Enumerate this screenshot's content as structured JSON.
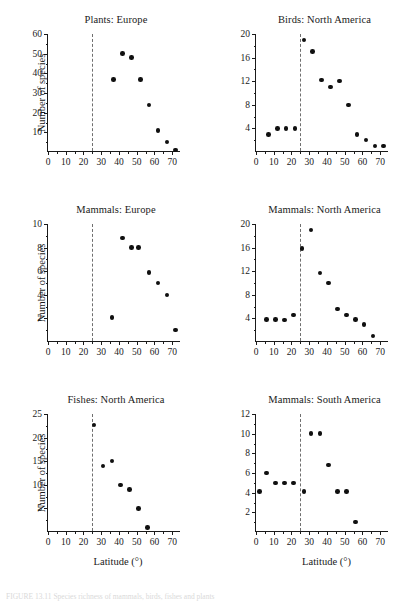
{
  "figure": {
    "caption_fragment": "FIGURE 13.11  Species richness of mammals, birds, fishes and plants",
    "dashed_line_label": "25",
    "shared_ylabel": "Number of species",
    "shared_xlabel": "Latitude (°)"
  },
  "chart_data": [
    {
      "type": "scatter",
      "title": "Plants: Europe",
      "xlabel": "",
      "ylabel": "Number of species",
      "xlim": [
        0,
        75
      ],
      "ylim": [
        0,
        60
      ],
      "xticks": [
        0,
        10,
        20,
        30,
        40,
        50,
        60,
        70
      ],
      "yticks": [
        10,
        20,
        30,
        40,
        50,
        60
      ],
      "xtick_labels": [
        "0",
        "10",
        "20",
        "30",
        "40",
        "50",
        "60",
        "70"
      ],
      "ytick_labels": [
        "10",
        "20",
        "30",
        "40",
        "50",
        "60"
      ],
      "grid": false,
      "legend": "none",
      "annotations": [
        {
          "type": "vline",
          "x": 25,
          "style": "dashed"
        }
      ],
      "x": [
        37,
        42,
        47,
        52,
        57,
        62,
        67,
        72
      ],
      "y": [
        37,
        50,
        48,
        37,
        24,
        11,
        5,
        1
      ]
    },
    {
      "type": "scatter",
      "title": "Birds: North America",
      "xlabel": "",
      "ylabel": "",
      "xlim": [
        0,
        75
      ],
      "ylim": [
        0,
        20
      ],
      "xticks": [
        0,
        10,
        20,
        30,
        40,
        50,
        60,
        70
      ],
      "yticks": [
        4,
        8,
        12,
        16,
        20
      ],
      "xtick_labels": [
        "0",
        "10",
        "20",
        "30",
        "40",
        "50",
        "60",
        "70"
      ],
      "ytick_labels": [
        "4",
        "8",
        "12",
        "16",
        "20"
      ],
      "grid": false,
      "legend": "none",
      "annotations": [
        {
          "type": "vline",
          "x": 25,
          "style": "dashed"
        }
      ],
      "x": [
        7,
        12,
        17,
        22,
        27,
        32,
        37,
        42,
        47,
        52,
        57,
        62,
        67,
        72
      ],
      "y": [
        3,
        4,
        4,
        4,
        19,
        17,
        12.2,
        11,
        12,
        8,
        3,
        2,
        1,
        1
      ]
    },
    {
      "type": "scatter",
      "title": "Mammals: Europe",
      "xlabel": "",
      "ylabel": "Number of species",
      "xlim": [
        0,
        75
      ],
      "ylim": [
        0,
        10
      ],
      "xticks": [
        0,
        10,
        20,
        30,
        40,
        50,
        60,
        70
      ],
      "yticks": [
        2,
        4,
        6,
        8,
        10
      ],
      "xtick_labels": [
        "0",
        "10",
        "20",
        "30",
        "40",
        "50",
        "60",
        "70"
      ],
      "ytick_labels": [
        "2",
        "4",
        "6",
        "8",
        "10"
      ],
      "grid": false,
      "legend": "none",
      "annotations": [
        {
          "type": "vline",
          "x": 25,
          "style": "dashed"
        }
      ],
      "x": [
        36,
        42,
        47,
        51,
        57,
        62,
        67,
        72
      ],
      "y": [
        2.1,
        8.8,
        8,
        8,
        5.9,
        5,
        4,
        1
      ]
    },
    {
      "type": "scatter",
      "title": "Mammals: North America",
      "xlabel": "",
      "ylabel": "",
      "xlim": [
        0,
        75
      ],
      "ylim": [
        0,
        20
      ],
      "xticks": [
        0,
        10,
        20,
        30,
        40,
        50,
        60,
        70
      ],
      "yticks": [
        4,
        8,
        12,
        16,
        20
      ],
      "xtick_labels": [
        "0",
        "10",
        "20",
        "30",
        "40",
        "50",
        "60",
        "70"
      ],
      "ytick_labels": [
        "4",
        "8",
        "12",
        "16",
        "20"
      ],
      "grid": false,
      "legend": "none",
      "annotations": [
        {
          "type": "vline",
          "x": 25,
          "style": "dashed"
        }
      ],
      "x": [
        6,
        11,
        16,
        21,
        26,
        31,
        36,
        41,
        46,
        51,
        56,
        61,
        66
      ],
      "y": [
        3.8,
        3.8,
        3.7,
        4.6,
        15.8,
        19,
        11.7,
        10,
        5.6,
        4.6,
        3.8,
        3,
        1
      ]
    },
    {
      "type": "scatter",
      "title": "Fishes: North America",
      "xlabel": "Latitude (°)",
      "ylabel": "Number of species",
      "xlim": [
        0,
        75
      ],
      "ylim": [
        0,
        25
      ],
      "xticks": [
        0,
        10,
        20,
        30,
        40,
        50,
        60,
        70
      ],
      "yticks": [
        5,
        10,
        15,
        20,
        25
      ],
      "xtick_labels": [
        "0",
        "10",
        "20",
        "30",
        "40",
        "50",
        "60",
        "70"
      ],
      "ytick_labels": [
        "5",
        "10",
        "15",
        "20",
        "25"
      ],
      "grid": false,
      "legend": "none",
      "annotations": [
        {
          "type": "vline",
          "x": 25,
          "style": "dashed"
        }
      ],
      "x": [
        26,
        31,
        36,
        41,
        46,
        51,
        56
      ],
      "y": [
        22.7,
        14,
        15,
        10,
        9,
        5,
        1
      ]
    },
    {
      "type": "scatter",
      "title": "Mammals: South America",
      "xlabel": "Latitude (°)",
      "ylabel": "",
      "xlim": [
        0,
        75
      ],
      "ylim": [
        0,
        12
      ],
      "xticks": [
        0,
        10,
        20,
        30,
        40,
        50,
        60,
        70
      ],
      "yticks": [
        2,
        4,
        6,
        8,
        10,
        12
      ],
      "xtick_labels": [
        "0",
        "10",
        "20",
        "30",
        "40",
        "50",
        "60",
        "70"
      ],
      "ytick_labels": [
        "2",
        "4",
        "6",
        "8",
        "10",
        "12"
      ],
      "grid": false,
      "legend": "none",
      "annotations": [
        {
          "type": "vline",
          "x": 25,
          "style": "dashed"
        }
      ],
      "x": [
        2,
        6,
        11,
        16,
        21,
        27,
        31,
        36,
        41,
        46,
        51,
        56
      ],
      "y": [
        4.1,
        6,
        5,
        5,
        5,
        4.1,
        10,
        10,
        6.8,
        4.1,
        4.1,
        1
      ]
    }
  ]
}
